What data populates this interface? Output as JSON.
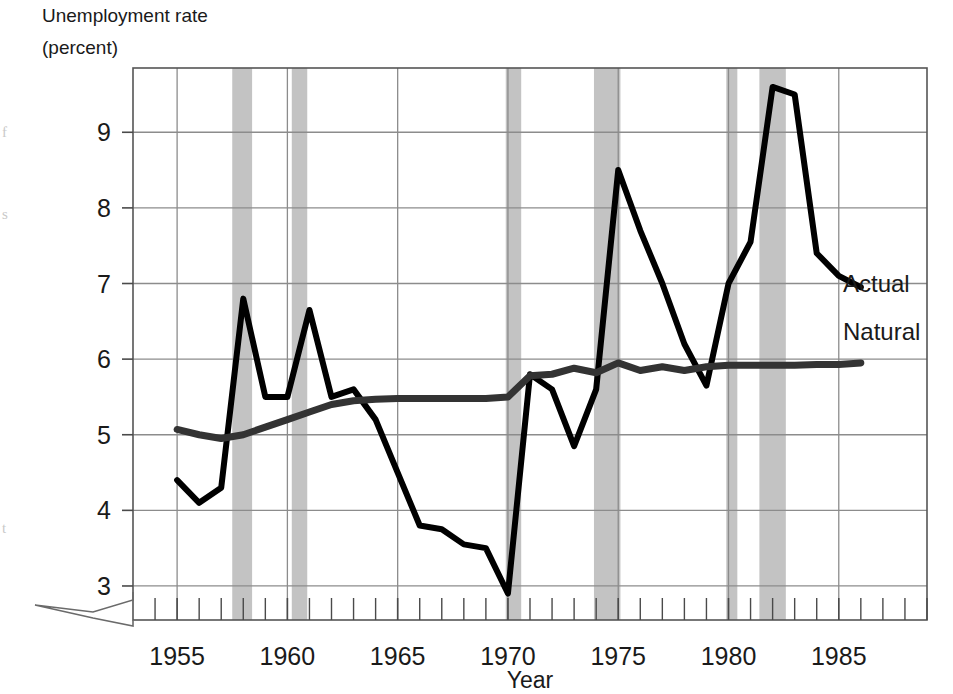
{
  "chart_data": {
    "type": "line",
    "title": "Unemployment rate",
    "subtitle": "(percent)",
    "xlabel": "Year",
    "ylabel": "",
    "xlim": [
      1953,
      1989
    ],
    "ylim": [
      2.55,
      9.85
    ],
    "axis_break": true,
    "grid": true,
    "legend_position": "right-inline",
    "y_ticks": [
      3,
      4,
      5,
      6,
      7,
      8,
      9
    ],
    "x_ticks_major": [
      1955,
      1960,
      1965,
      1970,
      1975,
      1980,
      1985
    ],
    "x_ticks_minor_step": 1,
    "series": [
      {
        "name": "Actual",
        "color": "#000000",
        "x": [
          1955,
          1956,
          1957,
          1958,
          1959,
          1960,
          1961,
          1962,
          1963,
          1964,
          1965,
          1966,
          1967,
          1968,
          1969,
          1970,
          1971,
          1972,
          1973,
          1974,
          1975,
          1976,
          1977,
          1978,
          1979,
          1980,
          1981,
          1982,
          1983,
          1984,
          1985,
          1986
        ],
        "values": [
          4.4,
          4.1,
          4.3,
          6.8,
          5.5,
          5.5,
          6.65,
          5.5,
          5.6,
          5.2,
          4.5,
          3.8,
          3.75,
          3.55,
          3.5,
          2.9,
          5.8,
          5.6,
          4.85,
          5.6,
          8.5,
          7.7,
          7.0,
          6.2,
          5.65,
          7.0,
          7.55,
          9.6,
          9.5,
          7.4,
          7.1,
          6.95
        ]
      },
      {
        "name": "Natural",
        "color": "#333333",
        "x": [
          1955,
          1956,
          1957,
          1958,
          1959,
          1960,
          1961,
          1962,
          1963,
          1964,
          1965,
          1966,
          1967,
          1968,
          1969,
          1970,
          1971,
          1972,
          1973,
          1974,
          1975,
          1976,
          1977,
          1978,
          1979,
          1980,
          1981,
          1982,
          1983,
          1984,
          1985,
          1986
        ],
        "values": [
          5.07,
          5.0,
          4.95,
          5.0,
          5.1,
          5.2,
          5.3,
          5.4,
          5.45,
          5.47,
          5.48,
          5.48,
          5.48,
          5.48,
          5.48,
          5.5,
          5.78,
          5.8,
          5.88,
          5.82,
          5.95,
          5.85,
          5.9,
          5.85,
          5.9,
          5.92,
          5.92,
          5.92,
          5.92,
          5.93,
          5.93,
          5.95
        ]
      }
    ],
    "recession_bands": [
      {
        "start": 1957.5,
        "end": 1958.4
      },
      {
        "start": 1960.2,
        "end": 1960.9
      },
      {
        "start": 1969.9,
        "end": 1970.6
      },
      {
        "start": 1973.9,
        "end": 1975.1
      },
      {
        "start": 1979.9,
        "end": 1980.4
      },
      {
        "start": 1981.4,
        "end": 1982.6
      }
    ],
    "band_color": "#9e9e9e",
    "grid_color": "#8c8c8c",
    "frame_color": "#555555"
  },
  "labels": {
    "title_line1": "Unemployment rate",
    "title_line2": "(percent)",
    "x_axis_title": "Year",
    "series_actual": "Actual",
    "series_natural": "Natural"
  },
  "y_tick_labels": [
    "9",
    "8",
    "7",
    "6",
    "5",
    "4",
    "3"
  ],
  "x_tick_labels": [
    "1955",
    "1960",
    "1965",
    "1970",
    "1975",
    "1980",
    "1985"
  ]
}
